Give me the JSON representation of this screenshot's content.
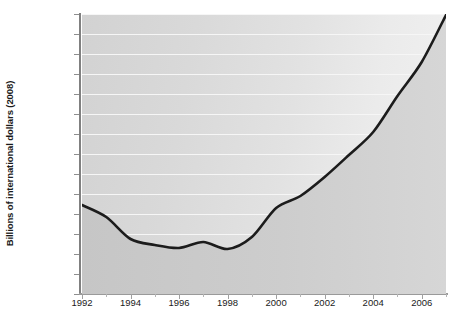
{
  "chart_data": {
    "type": "area",
    "title": "",
    "xlabel": "",
    "ylabel": "Billions of international dollars (2008)",
    "x": [
      1992,
      1993,
      1994,
      1995,
      1996,
      1997,
      1998,
      1999,
      2000,
      2001,
      2002,
      2003,
      2004,
      2005,
      2006,
      2007
    ],
    "values": [
      1145,
      1085,
      975,
      945,
      930,
      960,
      925,
      985,
      1130,
      1190,
      1285,
      1395,
      1510,
      1690,
      1860,
      2095
    ],
    "series": [
      {
        "name": "Billions of international dollars (2008)",
        "values": [
          1145,
          1085,
          975,
          945,
          930,
          960,
          925,
          985,
          1130,
          1190,
          1285,
          1395,
          1510,
          1690,
          1860,
          2095
        ]
      }
    ],
    "xlim": [
      1992,
      2007
    ],
    "ylim": [
      700,
      2100
    ],
    "ytick_labels": [
      "2100",
      "2000",
      "1900",
      "1800",
      "1700",
      "1600",
      "1500",
      "1400",
      "1300",
      "1200",
      "1100",
      "1000",
      "900",
      "800",
      "700"
    ],
    "ytick_values": [
      2100,
      2000,
      1900,
      1800,
      1700,
      1600,
      1500,
      1400,
      1300,
      1200,
      1100,
      1000,
      900,
      800,
      700
    ],
    "xtick_labels": [
      "1992",
      "1994",
      "1996",
      "1998",
      "2000",
      "2002",
      "2004",
      "2006"
    ],
    "xtick_values": [
      1992,
      1994,
      1996,
      1998,
      2000,
      2002,
      2004,
      2006
    ],
    "xtick_minor_values": [
      1993,
      1995,
      1997,
      1999,
      2001,
      2003,
      2005,
      2007
    ],
    "grid": true,
    "legend": "none",
    "line_color": "#1c1c1c",
    "grid_color": "#f6f6f6",
    "fill_top_color": "#ececec",
    "fill_bottom_color": "#c9c9c9"
  }
}
